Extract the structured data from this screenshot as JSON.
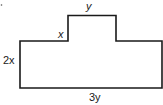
{
  "diagram": {
    "type": "composite-rectangle-shape",
    "labels": {
      "top": "y",
      "step": "x",
      "left": "2x",
      "bottom": "3y"
    },
    "stroke_color": "#1a1a1a",
    "background": "#ffffff"
  }
}
